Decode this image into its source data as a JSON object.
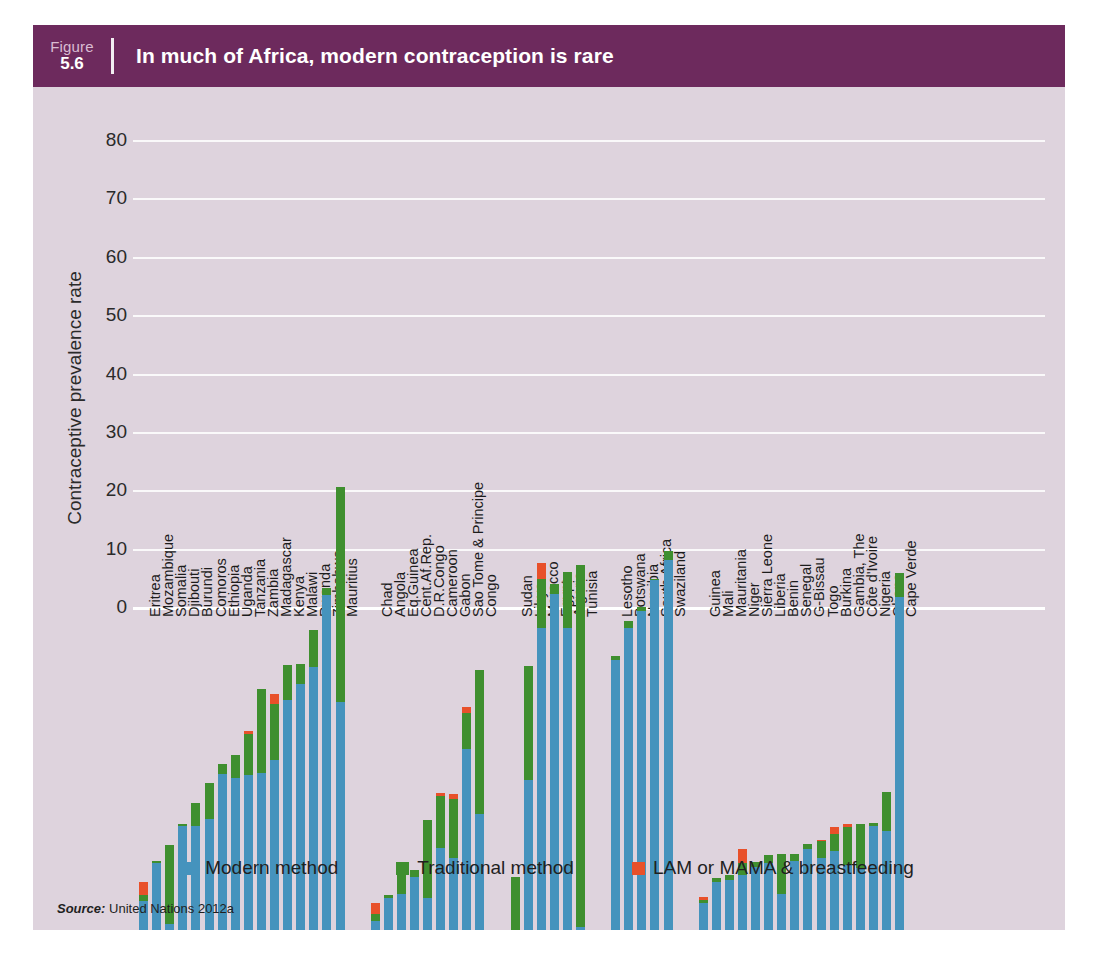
{
  "figure": {
    "number_word": "Figure",
    "number": "5.6",
    "title": "In much of Africa, modern contraception is rare",
    "header_color": "#6d2a5d",
    "panel_color": "#ded3dd"
  },
  "source": {
    "label": "Source:",
    "text": "United Nations 2012a"
  },
  "legend": {
    "items": [
      {
        "label": "Modern method",
        "color": "#4593bd",
        "key": "modern"
      },
      {
        "label": "Traditional method",
        "color": "#3f8f2f",
        "key": "traditional"
      },
      {
        "label": "LAM or MAMA & breastfeeding",
        "color": "#e8502a",
        "key": "lam"
      }
    ]
  },
  "chart_data": {
    "type": "bar",
    "subtype": "stacked",
    "title": "In much of Africa, modern contraception is rare",
    "xlabel": "",
    "ylabel": "Contraceptive prevalence rate",
    "ylim": [
      0,
      82
    ],
    "yticks": [
      0,
      10,
      20,
      30,
      40,
      50,
      60,
      70,
      80
    ],
    "grid": true,
    "legend_position": "bottom",
    "series": [
      {
        "name": "Modern method",
        "color": "#4593bd"
      },
      {
        "name": "Traditional method",
        "color": "#3f8f2f"
      },
      {
        "name": "LAM or MAMA & breastfeeding",
        "color": "#e8502a"
      }
    ],
    "groups": [
      {
        "name": "Eastern Africa",
        "categories": [
          "Eritrea",
          "Mozambique",
          "Somalia",
          "Djibouti",
          "Burundi",
          "Comoros",
          "Ethiopia",
          "Uganda",
          "Tanzania",
          "Zambia",
          "Madagascar",
          "Kenya",
          "Malawi",
          "Rwanda",
          "Zimbabwe",
          "Mauritius"
        ],
        "modern": [
          5.0,
          11.5,
          1.0,
          17.8,
          17.9,
          19.1,
          26.7,
          26.0,
          26.6,
          26.9,
          29.2,
          39.4,
          42.2,
          45.1,
          57.4,
          39.0
        ],
        "traditional": [
          1.0,
          0.3,
          13.5,
          0.3,
          3.9,
          6.1,
          1.7,
          4.0,
          7.0,
          14.4,
          9.5,
          6.0,
          3.3,
          6.3,
          1.2,
          36.9
        ],
        "lam": [
          2.2,
          0.0,
          0.0,
          0.0,
          0.0,
          0.0,
          0.0,
          0.0,
          0.5,
          0.0,
          1.8,
          0.0,
          0.0,
          0.0,
          0.0,
          0.0
        ],
        "totals": [
          8.2,
          11.8,
          14.5,
          18.1,
          21.8,
          25.2,
          28.4,
          30.0,
          34.1,
          41.3,
          40.5,
          45.4,
          45.5,
          51.4,
          58.6,
          75.9
        ]
      },
      {
        "name": "Middle Africa",
        "categories": [
          "Chad",
          "Angola",
          "Eq.Guinea",
          "Cent.Af.Rep.",
          "D.R.Congo",
          "Cameroon",
          "Gabon",
          "Sao Tome & Principe",
          "Congo"
        ],
        "modern": [
          1.6,
          5.4,
          6.1,
          9.0,
          5.4,
          14.0,
          12.3,
          31.0,
          19.9
        ],
        "traditional": [
          1.1,
          0.6,
          4.0,
          1.2,
          13.5,
          8.9,
          10.2,
          6.2,
          24.7
        ],
        "lam": [
          2.0,
          0.0,
          0.0,
          0.0,
          0.0,
          0.5,
          0.8,
          1.0,
          0.0
        ],
        "totals": [
          4.7,
          6.0,
          10.1,
          10.2,
          18.9,
          23.4,
          23.3,
          38.2,
          44.6
        ]
      },
      {
        "name": "Northern Africa",
        "categories": [
          "Sudan",
          "Libya",
          "Morocco",
          "Egypt",
          "Algeria",
          "Tunisia"
        ],
        "modern": [
          0.0,
          25.7,
          51.8,
          57.6,
          51.8,
          0.6
        ],
        "traditional": [
          9.0,
          19.5,
          8.3,
          1.6,
          9.6,
          61.9
        ],
        "lam": [
          0.0,
          0.0,
          2.7,
          0.0,
          0.0,
          0.0
        ],
        "totals": [
          9.0,
          45.2,
          62.8,
          59.2,
          61.4,
          62.5
        ]
      },
      {
        "name": "Southern Africa",
        "categories": [
          "Lesotho",
          "Botswana",
          "Namibia",
          "South Africa",
          "Swaziland"
        ],
        "modern": [
          46.2,
          51.7,
          54.6,
          59.9,
          63.4
        ],
        "traditional": [
          0.8,
          1.3,
          0.7,
          0.2,
          1.6
        ],
        "lam": [
          0.0,
          0.0,
          0.0,
          0.0,
          0.0
        ],
        "totals": [
          47.0,
          53.0,
          55.3,
          60.1,
          65.0
        ]
      },
      {
        "name": "Western Africa",
        "categories": [
          "Guinea",
          "Mali",
          "Mauritania",
          "Niger",
          "Sierra Leone",
          "Liberia",
          "Benin",
          "Senegal",
          "G-Bissau",
          "Togo",
          "Burkina",
          "Gambia, The",
          "Côte d'Ivoire",
          "Nigeria",
          "Ghana",
          "Cape Verde"
        ],
        "modern": [
          4.6,
          8.2,
          8.6,
          9.5,
          10.8,
          11.4,
          6.2,
          11.8,
          13.8,
          12.4,
          13.6,
          11.1,
          10.7,
          17.9,
          17.0,
          57.1
        ],
        "traditional": [
          0.5,
          0.7,
          0.8,
          2.0,
          0.8,
          1.4,
          6.9,
          1.3,
          0.9,
          2.8,
          2.9,
          6.5,
          7.5,
          0.4,
          6.6,
          4.1
        ],
        "lam": [
          0.5,
          0.0,
          0.0,
          2.4,
          0.0,
          0.0,
          0.0,
          0.0,
          0.0,
          0.3,
          1.1,
          0.5,
          0.0,
          0.0,
          0.0,
          0.0
        ],
        "totals": [
          5.6,
          8.9,
          9.4,
          13.9,
          11.6,
          12.8,
          13.1,
          13.1,
          14.7,
          15.5,
          17.6,
          18.1,
          18.2,
          18.3,
          23.6,
          61.2
        ]
      }
    ]
  }
}
